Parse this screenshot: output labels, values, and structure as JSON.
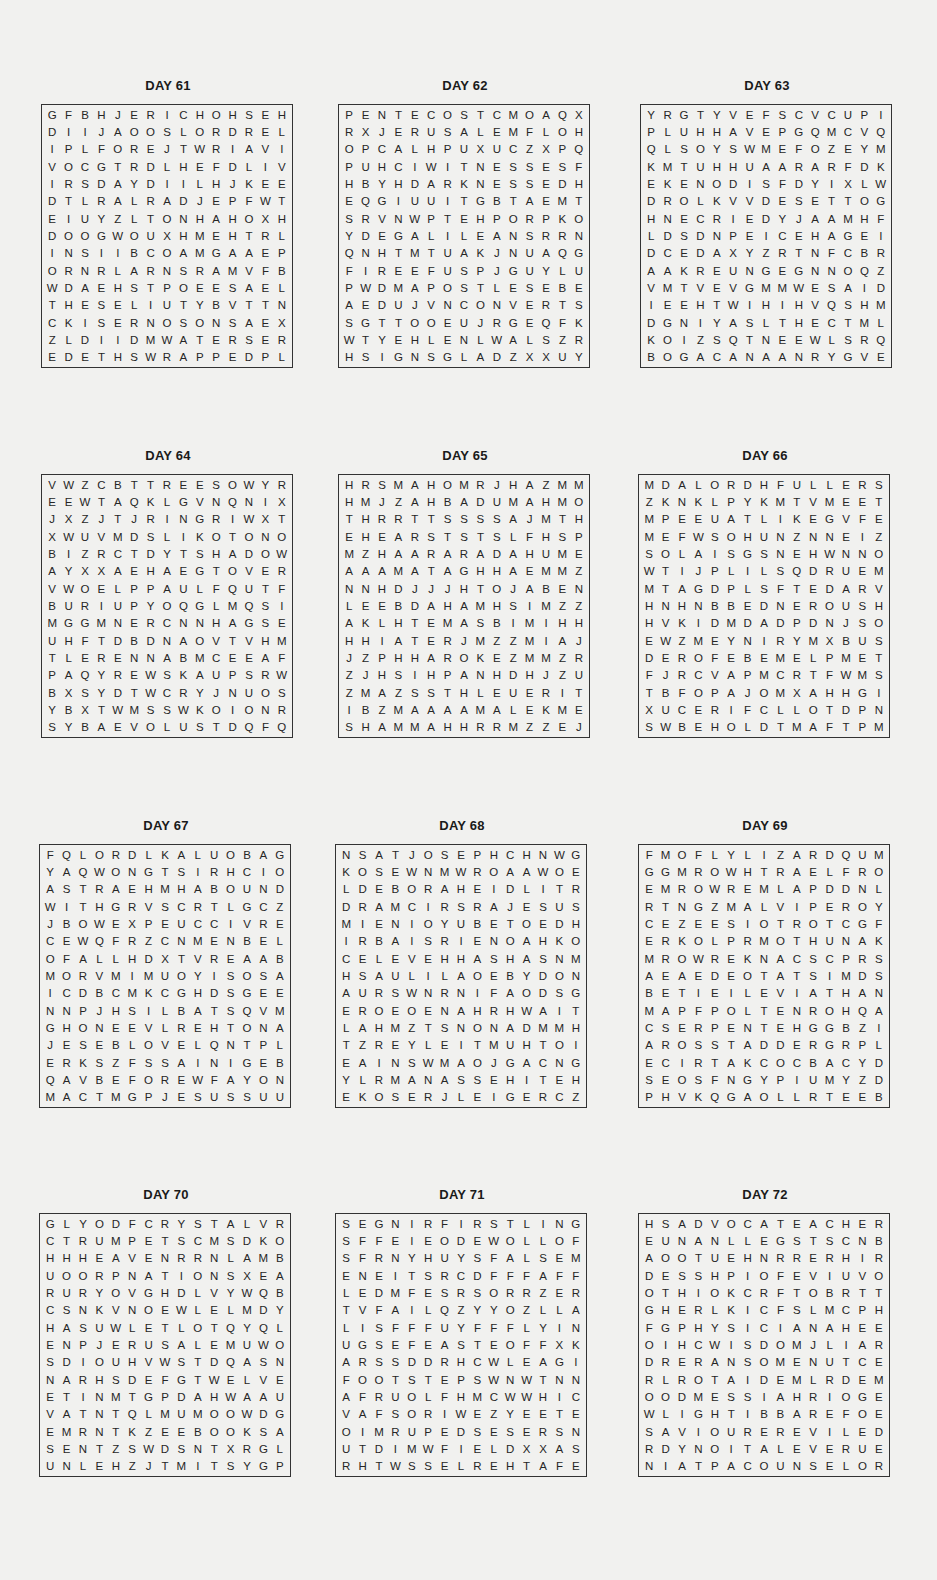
{
  "puzzles": [
    {
      "title": "DAY 61",
      "x": 41,
      "y": 78,
      "rows": [
        "GFBHJERICHOHSEH",
        "DIIJAOOSLORDREL",
        "IPLFOREJTWRIAVI",
        "VOCGTRDLHEFDLIV",
        "IRSDAYDIILHJKEE",
        "DTLRALRADJEPFWT",
        "EIUYZLTONHAHOXH",
        "DOOGWOUXHMEHTRL",
        "INSIIBCOAMGAAEP",
        "ORNRLARNSRAMVFB",
        "WDAEHSTPOEESAEL",
        "THESELIUTYBVTTN",
        "CKISERNOSONSAEX",
        "ZLDIIDMWATERSER",
        "EDETHSWRAPPEDPL"
      ]
    },
    {
      "title": "DAY 62",
      "x": 338,
      "y": 78,
      "rows": [
        "PENTECOSTCMOAQX",
        "RXJERUSALEMFLOH",
        "OPCALHPUXUCZXPQ",
        "PUHCIWITNESSESF",
        "HBYHDARKNESSEDH",
        "EQGIUUITGBTAEMT",
        "SRVNWPTEHPORPKO",
        "YDEGALILEANSRRN",
        "QNHTMTUAKJNUAQG",
        "FIREEFUSPJGUYLU",
        "PWDMAPOSTLESEBE",
        "AEDUJVNCONVERTS",
        "SGTTOOEUJRGEQFK",
        "WTYEHLENLWALSZR",
        "HSIGNSGLADZXXUY"
      ]
    },
    {
      "title": "DAY 63",
      "x": 640,
      "y": 78,
      "rows": [
        "YRGTYVEFSCVCUPI",
        "PLUHHAVEPGQMCVQ",
        "QLSOYSWMEFOZEYM",
        "KMTUHHUAARARFDK",
        "EKENODISFDYIXLW",
        "DROLKVVDESETTOG",
        "HNECRIEDYJAAMHF",
        "LDSDNPEICEHAGEI",
        "DCEDAXYZRTNFCBR",
        "AAKREUNGEGNNOQZ",
        "VMTVEVGMMWESAID",
        "IEEHTWIHIHVQSHM",
        "DGNIYASLTHECTML",
        "KOIZSQTNEEWLSRQ",
        "BOGACANAANRYGVE"
      ]
    },
    {
      "title": "DAY 64",
      "x": 41,
      "y": 448,
      "rows": [
        "VWZCBTTREESOWYR",
        "EEWTAQKLGVNQNIX",
        "JXZJTJRINGRIWXT",
        "XWUVMDSLIKOTONO",
        "BIZRCTDYTSHADOW",
        "AYXXAEHAEGTOVER",
        "VWOELPPAULFQUTF",
        "BURIUPYOQGLMQSI",
        "MGGMNERCNNHAGSE",
        "UHFTDBDNAOVTVHM",
        "TLERENNABMCEEAF",
        "PAQYREWSKAUPSRW",
        "BXSYDTWCRYJNUOS",
        "YBXTWMSSWKOIONR",
        "SYBAEVOLUSTDQFQ"
      ]
    },
    {
      "title": "DAY 65",
      "x": 338,
      "y": 448,
      "rows": [
        "HRSMAHOMRJHAZMM",
        "HMJZAHBADUMAHMO",
        "THRRTTSSSSAJMTH",
        "EHEARSTSTSLFHSP",
        "MZHAARARADAHUME",
        "AAAMATAGHHAEMMZ",
        "NNHDJJJHTOJABEN",
        "LEEBDAHAMHSIMZZ",
        "AKLHTEMASBIMIHH",
        "HHIATERJMZZMIAJ",
        "JZPHHAROKEZMMZR",
        "ZJHSIHPANHDHJZU",
        "ZMAZSSTHLEUERIT",
        "IBZMAAAAMALEKME",
        "SHAMMAHHRRMZZEJ"
      ]
    },
    {
      "title": "DAY 66",
      "x": 638,
      "y": 448,
      "rows": [
        "MDALORDHFULLERS",
        "ZKNKLPYKMTVMEET",
        "MPEEUATLIKEGVFE",
        "MEFWSOHUNZNNEIZ",
        "SOLAISGSNEHWNNO",
        "WTIJPLILSQDRUEM",
        "MTAGDPLSFTEDARV",
        "HNHNBBEDNEROUSH",
        "HVKIDMDADPDNJSO",
        "EWZMEYNIRYMXBUS",
        "DEROFEBEMELPMET",
        "FJRCVAPMCRTFWMS",
        "TBFOPAJOMXAHHGI",
        "XUCERIFCLLOTDPN",
        "SWBEHOLDTMAFTPM"
      ]
    },
    {
      "title": "DAY 67",
      "x": 39,
      "y": 818,
      "rows": [
        "FQLORDLKALUOBAG",
        "YAQWONGTSIRHCIO",
        "ASTRAEHMHABOUND",
        "WITHGRVSCRTLGCZ",
        "JBOWEXPEUCCIVRE",
        "CEWQFRZCNMENBEL",
        "OFALLHDXTVREAAB",
        "MORVMIMUOYISOSA",
        "ICDBCMKCGHDSGEE",
        "NNPJHSILBATSQVM",
        "GHONEEVLREHTONA",
        "JESEBLOVELQNTPL",
        "ERKSZFSSAINIGEB",
        "QAVBEFOREWFAYON",
        "MACTMGPJESUSSUU"
      ]
    },
    {
      "title": "DAY 68",
      "x": 335,
      "y": 818,
      "rows": [
        "NSATJOSEPHCHNWG",
        "KOSEWNMWROAAWOE",
        "LDEBORAHEIDLITR",
        "DRAMCIRSRAJESUS",
        "MIENIOYUBETOEDH",
        "IRBAISRIENOAHKO",
        "CELEVEHHASHASNM",
        "HSAULILAOEBYDON",
        "AURSWNRNIFAODSG",
        "EROEOENAHRHWAIT",
        "LAHMZTSNONADMMH",
        "TZREYLEITMUHTOI",
        "EAINSWMAOJGACNG",
        "YLRMANASSEHITEH",
        "EKOSERJLEIGERCZ"
      ]
    },
    {
      "title": "DAY 69",
      "x": 638,
      "y": 818,
      "rows": [
        "FMOFLYLIZARDQUM",
        "GGMROWHTRAELFRO",
        "EMROWREMLAPDDNL",
        "RTNGZMALVIPEROY",
        "CEZEESIOTROTCGF",
        "ERKOLPRMOTHUNAK",
        "MROWREKNACSCPRS",
        "AEAEDEOTATSIMDS",
        "BETIEILEVIATHAN",
        "MAPFPOLTENROHQA",
        "CSERPENTEHGGBZI",
        "AROSSTADDERGRPL",
        "ECIRTAKCOCBACYD",
        "SEOSFNGYPIUMYZD",
        "PHVKQGAOLLRTEEB"
      ]
    },
    {
      "title": "DAY 70",
      "x": 39,
      "y": 1187,
      "rows": [
        "GLYODFCRYSTALVR",
        "CTRUMPETSCMSDKO",
        "HHHEAVENRRNLAMB",
        "UOORPNATIONSXEA",
        "RURYOVGHDLVYWQB",
        "CSNKVNOEWLELMDY",
        "HASUWLETLOTQYQL",
        "ENPJERUSALEMUWO",
        "SDIOUHVWSTDQASN",
        "NARHSDEFGTWELVE",
        "ETINMTGPDAHWAAU",
        "VATNTQLMUMOOWDG",
        "EMRNTKZEEBOOKSA",
        "SENTZSWDSNTXRGL",
        "UNLEHZJTMITSYGP"
      ]
    },
    {
      "title": "DAY 71",
      "x": 335,
      "y": 1187,
      "rows": [
        "SEGNIRFIRSTLING",
        "SFFEIEODEWOLLOF",
        "SFRNYHUYSFALSEM",
        "ENEITSRCDFFFAFF",
        "LEDMFESRSORRZER",
        "TVFAILQZYYOZLLA",
        "LISFFFUYFFFLYIN",
        "UGSEFEASTEOFFXK",
        "ARSSDDRHCWLEAGI",
        "FOOTSTEPSWNWTNN",
        "AFRUOLFHMCWWHIC",
        "VAFSORIWEZYEETE",
        "OIMRUPEDSESERSN",
        "UTDIMWFIELDXXAS",
        "RHTWSSELREHTAFE"
      ]
    },
    {
      "title": "DAY 72",
      "x": 638,
      "y": 1187,
      "rows": [
        "HSADVOCATEACHER",
        "EUNANLLEGSTSCNB",
        "AOOTUEHNRRERHIR",
        "DESSHPIOFEVIUVO",
        "OTHIOKCRFTOBRTT",
        "GHERLKICFSLMCPH",
        "FGPHYSICIANAHEE",
        "OIHCWISDOMJLIAR",
        "DRERANSOMENUTCE",
        "RLROTAIDEMLRDEM",
        "OODMESSIAHRIOGE",
        "WLIGHTIBBAREFOE",
        "SAVIOUREREVILED",
        "RDYNOITALEVERUE",
        "NIATPACOUNSELOR"
      ]
    }
  ]
}
